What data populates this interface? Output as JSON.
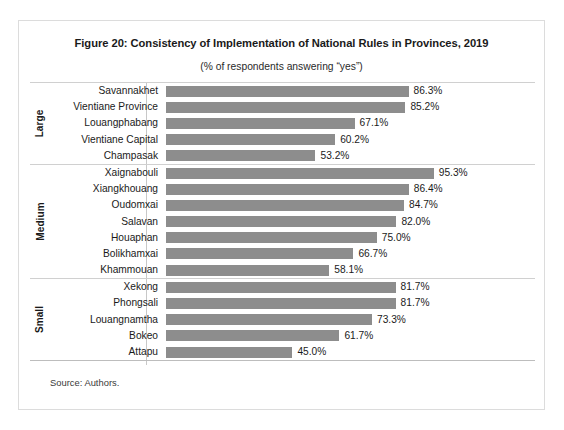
{
  "figure": {
    "title": "Figure 20: Consistency of Implementation of National Rules in Provinces, 2019",
    "subtitle": "(% of respondents answering “yes”)",
    "source": "Source: Authors."
  },
  "chart_data": {
    "type": "bar",
    "orientation": "horizontal",
    "title": "Figure 20: Consistency of Implementation of National Rules in Provinces, 2019",
    "subtitle": "(% of respondents answering “yes”)",
    "xlabel": "",
    "ylabel": "",
    "xlim": [
      0,
      100
    ],
    "grid": false,
    "legend": false,
    "bar_color": "#8d8d8d",
    "value_suffix": "%",
    "categories": [
      "Savannakhet",
      "Vientiane Province",
      "Louangphabang",
      "Vientiane Capital",
      "Champasak",
      "Xaignabouli",
      "Xiangkhouang",
      "Oudomxai",
      "Salavan",
      "Houaphan",
      "Bolikhamxai",
      "Khammouan",
      "Xekong",
      "Phongsali",
      "Louangnamtha",
      "Bokeo",
      "Attapu"
    ],
    "values": [
      86.3,
      85.2,
      67.1,
      60.2,
      53.2,
      95.3,
      86.4,
      84.7,
      82.0,
      75.0,
      66.7,
      58.1,
      81.7,
      81.7,
      73.3,
      61.7,
      45.0
    ],
    "groups": [
      {
        "label": "Large",
        "rows": [
          {
            "category": "Savannakhet",
            "value": 86.3,
            "value_label": "86.3%"
          },
          {
            "category": "Vientiane Province",
            "value": 85.2,
            "value_label": "85.2%"
          },
          {
            "category": "Louangphabang",
            "value": 67.1,
            "value_label": "67.1%"
          },
          {
            "category": "Vientiane Capital",
            "value": 60.2,
            "value_label": "60.2%"
          },
          {
            "category": "Champasak",
            "value": 53.2,
            "value_label": "53.2%"
          }
        ]
      },
      {
        "label": "Medium",
        "rows": [
          {
            "category": "Xaignabouli",
            "value": 95.3,
            "value_label": "95.3%"
          },
          {
            "category": "Xiangkhouang",
            "value": 86.4,
            "value_label": "86.4%"
          },
          {
            "category": "Oudomxai",
            "value": 84.7,
            "value_label": "84.7%"
          },
          {
            "category": "Salavan",
            "value": 82.0,
            "value_label": "82.0%"
          },
          {
            "category": "Houaphan",
            "value": 75.0,
            "value_label": "75.0%"
          },
          {
            "category": "Bolikhamxai",
            "value": 66.7,
            "value_label": "66.7%"
          },
          {
            "category": "Khammouan",
            "value": 58.1,
            "value_label": "58.1%"
          }
        ]
      },
      {
        "label": "Small",
        "rows": [
          {
            "category": "Xekong",
            "value": 81.7,
            "value_label": "81.7%"
          },
          {
            "category": "Phongsali",
            "value": 81.7,
            "value_label": "81.7%"
          },
          {
            "category": "Louangnamtha",
            "value": 73.3,
            "value_label": "73.3%"
          },
          {
            "category": "Bokeo",
            "value": 61.7,
            "value_label": "61.7%"
          },
          {
            "category": "Attapu",
            "value": 45.0,
            "value_label": "45.0%"
          }
        ]
      }
    ]
  }
}
